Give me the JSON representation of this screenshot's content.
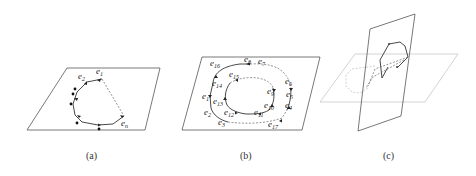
{
  "figure": {
    "panels": [
      {
        "id": "a",
        "caption": "(a)",
        "labels": [
          {
            "base": "e",
            "sub": "2"
          },
          {
            "base": "e",
            "sub": "1"
          },
          {
            "base": "e",
            "sub": "n"
          }
        ]
      },
      {
        "id": "b",
        "caption": "(b)",
        "labels": [
          {
            "base": "e",
            "sub": "16"
          },
          {
            "base": "e",
            "sub": "8"
          },
          {
            "base": "e",
            "sub": "7"
          },
          {
            "base": "e",
            "sub": "15"
          },
          {
            "base": "e",
            "sub": "14"
          },
          {
            "base": "e",
            "sub": "6"
          },
          {
            "base": "e",
            "sub": "9"
          },
          {
            "base": "e",
            "sub": "5"
          },
          {
            "base": "e",
            "sub": "1"
          },
          {
            "base": "e",
            "sub": "13"
          },
          {
            "base": "e",
            "sub": "10"
          },
          {
            "base": "e",
            "sub": "4"
          },
          {
            "base": "e",
            "sub": "2"
          },
          {
            "base": "e",
            "sub": "12"
          },
          {
            "base": "e",
            "sub": "11"
          },
          {
            "base": "e",
            "sub": "3"
          },
          {
            "base": "e",
            "sub": "17"
          }
        ]
      },
      {
        "id": "c",
        "caption": "(c)"
      }
    ]
  }
}
